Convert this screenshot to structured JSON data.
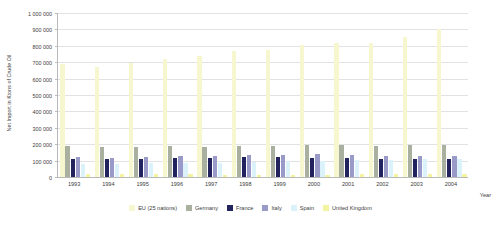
{
  "chart_data": {
    "type": "bar",
    "title": "",
    "xlabel": "Year",
    "ylabel": "Net Import in Ktons of Crude Oil",
    "categories": [
      "1993",
      "1994",
      "1995",
      "1996",
      "1997",
      "1998",
      "1999",
      "2000",
      "2001",
      "2002",
      "2003",
      "2004"
    ],
    "ylim": [
      0,
      1000000
    ],
    "ytick_labels": [
      "0",
      "100 000",
      "200 000",
      "300 000",
      "400 000",
      "500 000",
      "600 000",
      "700 000",
      "800 000",
      "900 000",
      "1 000 000"
    ],
    "ytick_values": [
      0,
      100000,
      200000,
      300000,
      400000,
      500000,
      600000,
      700000,
      800000,
      900000,
      1000000
    ],
    "grid": true,
    "legend_position": "bottom",
    "series": [
      {
        "name": "EU (25 nations)",
        "color": "#f7f7cf",
        "values": [
          690000,
          672000,
          697000,
          722000,
          740000,
          770000,
          775000,
          805000,
          820000,
          820000,
          855000,
          905000
        ]
      },
      {
        "name": "Germany",
        "color": "#a9b0a0",
        "values": [
          190000,
          180000,
          182000,
          188000,
          185000,
          190000,
          190000,
          195000,
          198000,
          190000,
          195000,
          195000
        ]
      },
      {
        "name": "France",
        "color": "#22225e",
        "values": [
          112000,
          108000,
          112000,
          115000,
          118000,
          122000,
          120000,
          118000,
          115000,
          112000,
          112000,
          112000
        ]
      },
      {
        "name": "Italy",
        "color": "#9a9ac8",
        "values": [
          122000,
          118000,
          122000,
          128000,
          128000,
          132000,
          135000,
          138000,
          132000,
          130000,
          130000,
          128000
        ]
      },
      {
        "name": "Spain",
        "color": "#dcf2fb",
        "values": [
          78000,
          80000,
          84000,
          86000,
          88000,
          92000,
          95000,
          100000,
          102000,
          104000,
          108000,
          110000
        ]
      },
      {
        "name": "United Kingdom",
        "color": "#f4f4a0",
        "values": [
          20000,
          20000,
          18000,
          16000,
          15000,
          15000,
          14000,
          14000,
          16000,
          16000,
          18000,
          20000
        ]
      }
    ]
  }
}
